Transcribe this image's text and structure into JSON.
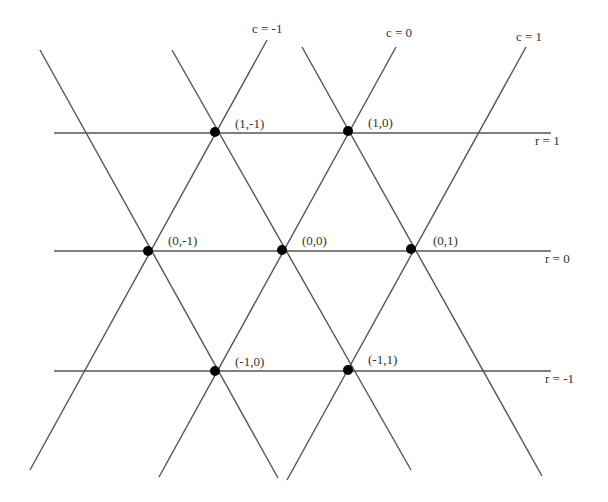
{
  "diagram": {
    "type": "triangular-lattice",
    "line_color": "#555555",
    "point_color": "#000000",
    "row_lines": [
      {
        "label": "r = 1",
        "y": 133,
        "x1": 54,
        "x2": 551,
        "label_x": 535,
        "label_y": 145
      },
      {
        "label": "r = 0",
        "y": 251,
        "x1": 54,
        "x2": 551,
        "label_x": 545,
        "label_y": 263
      },
      {
        "label": "r = -1",
        "y": 371,
        "x1": 54,
        "x2": 551,
        "label_x": 545,
        "label_y": 383
      }
    ],
    "column_lines": [
      {
        "label": "c = -1",
        "x1": 267,
        "y1": 40,
        "x2": 30,
        "y2": 470,
        "label_x": 252,
        "label_y": 33
      },
      {
        "label": "c = 0",
        "x1": 396,
        "y1": 47,
        "x2": 159,
        "y2": 477,
        "label_x": 386,
        "label_y": 37
      },
      {
        "label": "c = 1",
        "x1": 526,
        "y1": 47,
        "x2": 287,
        "y2": 480,
        "label_x": 516,
        "label_y": 41
      }
    ],
    "diagonal_lines": [
      {
        "x1": 40,
        "y1": 50,
        "x2": 278,
        "y2": 478
      },
      {
        "x1": 172,
        "y1": 50,
        "x2": 411,
        "y2": 470
      },
      {
        "x1": 302,
        "y1": 47,
        "x2": 542,
        "y2": 476
      }
    ],
    "points": [
      {
        "label": "(1,-1)",
        "x": 215,
        "y": 132,
        "label_x": 235,
        "label_y": 128
      },
      {
        "label": "(1,0)",
        "x": 348,
        "y": 131,
        "label_x": 368,
        "label_y": 127
      },
      {
        "label": "(0,-1)",
        "x": 148,
        "y": 251,
        "label_x": 168,
        "label_y": 245
      },
      {
        "label": "(0,0)",
        "x": 282,
        "y": 250,
        "label_x": 302,
        "label_y": 245
      },
      {
        "label": "(0,1)",
        "x": 411,
        "y": 249,
        "label_x": 433,
        "label_y": 245
      },
      {
        "label": "(-1,0)",
        "x": 215,
        "y": 371,
        "label_x": 235,
        "label_y": 366
      },
      {
        "label": "(-1,1)",
        "x": 348,
        "y": 370,
        "label_x": 368,
        "label_y": 364
      }
    ]
  }
}
